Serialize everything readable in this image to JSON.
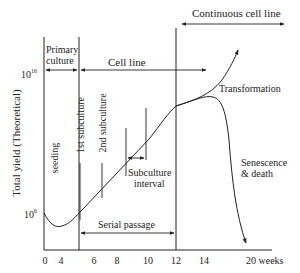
{
  "diagram": {
    "type": "growth-curve",
    "y_axis": {
      "label": "Total yield (Theoretical)",
      "ticks": [
        {
          "base": "10",
          "exp": "6",
          "label": "10^6"
        },
        {
          "base": "10",
          "exp": "16",
          "label": "10^16"
        }
      ]
    },
    "x_axis": {
      "ticks": [
        "0",
        "4",
        "6",
        "8",
        "10",
        "12",
        "14",
        "20 weeks"
      ]
    },
    "regions": {
      "primary_culture": "Primary\nculture",
      "primary_line1": "Primary",
      "primary_line2": "culture",
      "cell_line": "Cell line",
      "continuous_cell_line": "Continuous cell line",
      "serial_passage": "Serial passage"
    },
    "annotations": {
      "seeding": "seeding",
      "first_subculture": "1st subculture",
      "second_subculture": "2nd subculture",
      "subculture_interval_line1": "Subculture",
      "subculture_interval_line2": "interval",
      "transformation": "Transformation",
      "senescence_line1": "Senescence",
      "senescence_line2": "& death"
    },
    "colors": {
      "line": "#222222",
      "background": "#ffffff"
    }
  }
}
